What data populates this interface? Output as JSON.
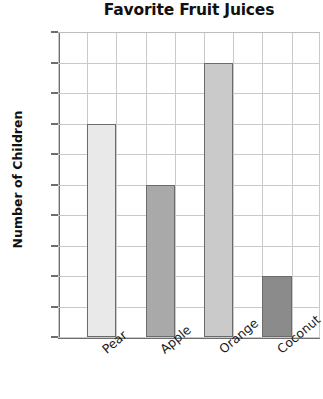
{
  "chart_data": {
    "type": "bar",
    "title": "Favorite Fruit Juices",
    "xlabel": "",
    "ylabel": "Number of Children",
    "categories": [
      "Pear",
      "Apple",
      "Orange",
      "Coconut"
    ],
    "values": [
      7,
      5,
      9,
      2
    ],
    "bar_colors": [
      "#e9e9e9",
      "#a9a9a9",
      "#cacaca",
      "#8b8b8b"
    ],
    "bar_border_color": "#6b6b6b",
    "ylim": [
      0,
      10
    ],
    "ytick_labels": [
      "0",
      "1",
      "2",
      "3",
      "4",
      "5",
      "6",
      "7",
      "8",
      "9",
      "10"
    ],
    "ytick_values": [
      0,
      1,
      2,
      3,
      4,
      5,
      6,
      7,
      8,
      9,
      10
    ],
    "grid": true,
    "grid_color": "#c9c9c9",
    "axis_color": "#6e6e6e",
    "legend": null,
    "legend_position": "none",
    "x_label_rotation": -40
  }
}
